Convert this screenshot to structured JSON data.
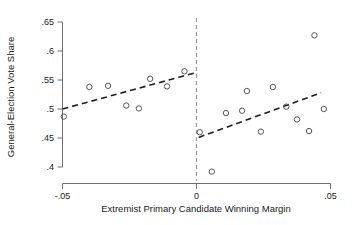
{
  "chart_data": {
    "type": "scatter",
    "title": "",
    "xlabel": "Extremist Primary Candidate Winning Margin",
    "ylabel": "General-Election Vote Share",
    "xlim": [
      -0.05,
      0.05
    ],
    "ylim": [
      0.4,
      0.65
    ],
    "grid": false,
    "legend": false,
    "xticks": [
      -0.05,
      0,
      0.05
    ],
    "xtick_labels": [
      "-.05",
      "0",
      ".05"
    ],
    "yticks": [
      0.4,
      0.45,
      0.5,
      0.55,
      0.6,
      0.65
    ],
    "ytick_labels": [
      ".4",
      ".45",
      ".5",
      ".55",
      ".6",
      ".65"
    ],
    "annotations": [
      {
        "name": "cutoff-line",
        "type": "vline",
        "x": 0,
        "style": "dashed",
        "color": "#9a9a9a"
      }
    ],
    "series": [
      {
        "name": "Left of cutoff (losing margin)",
        "marker": "open-circle",
        "color": "#555555",
        "points": [
          {
            "x": -0.0495,
            "y": 0.487
          },
          {
            "x": -0.04,
            "y": 0.538
          },
          {
            "x": -0.033,
            "y": 0.54
          },
          {
            "x": -0.0262,
            "y": 0.506
          },
          {
            "x": -0.0215,
            "y": 0.501
          },
          {
            "x": -0.0173,
            "y": 0.552
          },
          {
            "x": -0.011,
            "y": 0.539
          },
          {
            "x": -0.0045,
            "y": 0.565
          }
        ]
      },
      {
        "name": "Right of cutoff (winning margin)",
        "marker": "open-circle",
        "color": "#555555",
        "points": [
          {
            "x": 0.0012,
            "y": 0.46
          },
          {
            "x": 0.0057,
            "y": 0.392
          },
          {
            "x": 0.011,
            "y": 0.493
          },
          {
            "x": 0.017,
            "y": 0.497
          },
          {
            "x": 0.0188,
            "y": 0.531
          },
          {
            "x": 0.024,
            "y": 0.461
          },
          {
            "x": 0.0285,
            "y": 0.538
          },
          {
            "x": 0.0335,
            "y": 0.504
          },
          {
            "x": 0.0375,
            "y": 0.482
          },
          {
            "x": 0.042,
            "y": 0.462
          },
          {
            "x": 0.044,
            "y": 0.627
          },
          {
            "x": 0.0475,
            "y": 0.5
          }
        ]
      }
    ],
    "fits": [
      {
        "name": "left-fit-line",
        "style": "dashed",
        "color": "#1d1d1d",
        "x0": -0.05,
        "y0": 0.5,
        "x1": -0.0008,
        "y1": 0.562
      },
      {
        "name": "right-fit-line",
        "style": "dashed",
        "color": "#1d1d1d",
        "x0": 0.0008,
        "y0": 0.451,
        "x1": 0.0465,
        "y1": 0.528
      }
    ]
  }
}
